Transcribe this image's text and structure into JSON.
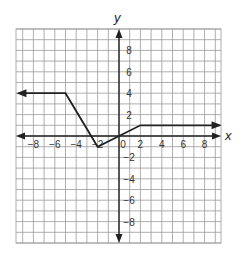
{
  "chart_data": {
    "type": "line",
    "title": "",
    "xlabel": "x",
    "ylabel": "y",
    "xlim": [
      -9.6,
      9.6
    ],
    "ylim": [
      -10,
      10
    ],
    "grid": true,
    "x_ticks": [
      -8,
      -6,
      -4,
      -2,
      0,
      2,
      4,
      6,
      8
    ],
    "y_ticks": [
      -8,
      -6,
      -4,
      -2,
      2,
      4,
      6,
      8
    ],
    "x_tick_labels": [
      "−8",
      "−6",
      "−4",
      "−2",
      "0",
      "2",
      "4",
      "6",
      "8"
    ],
    "y_tick_labels": [
      "−8",
      "−6",
      "−4",
      "−2",
      "2",
      "4",
      "6",
      "8"
    ],
    "series": [
      {
        "name": "piecewise function",
        "points": [
          [
            -9.4,
            4
          ],
          [
            -5,
            4
          ],
          [
            -2,
            -1
          ],
          [
            2,
            1
          ],
          [
            9.4,
            1
          ]
        ],
        "left_arrow": true,
        "right_arrow": true,
        "color": "#222222"
      }
    ]
  },
  "colors": {
    "grid": "#9a9a9a",
    "axis": "#222222",
    "curve": "#222222"
  }
}
